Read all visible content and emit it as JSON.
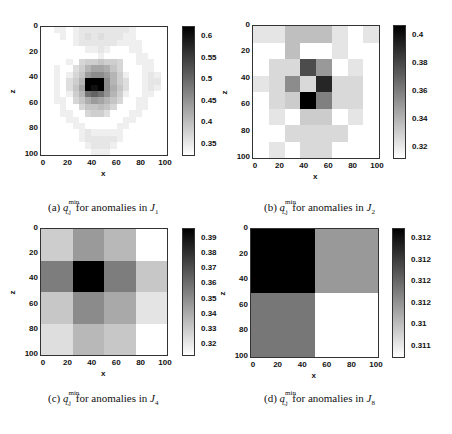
{
  "chart_data": [
    {
      "type": "heatmap",
      "id": "a",
      "title": "(a) a_{i,j}^{min} for anomalies in J_1",
      "caption_prefix": "(a)",
      "caption_sub_label": "J",
      "caption_sub_index": "1",
      "xlabel": "x",
      "ylabel": "z",
      "x_ticks": [
        "0",
        "20",
        "40",
        "60",
        "80",
        "100"
      ],
      "y_ticks": [
        "0",
        "20",
        "40",
        "60",
        "80",
        "100"
      ],
      "colorbar_ticks": [
        "0.6",
        "0.55",
        "0.5",
        "0.45",
        "0.4",
        "0.35"
      ],
      "colorbar_range": [
        0.31,
        0.62
      ],
      "grid_size": [
        20,
        20
      ],
      "values": [
        [
          0.31,
          0.31,
          0.33,
          0.33,
          0.31,
          0.33,
          0.34,
          0.34,
          0.34,
          0.34,
          0.34,
          0.34,
          0.34,
          0.34,
          0.33,
          0.31,
          0.31,
          0.31,
          0.31,
          0.31
        ],
        [
          0.31,
          0.31,
          0.31,
          0.33,
          0.31,
          0.33,
          0.34,
          0.35,
          0.34,
          0.35,
          0.34,
          0.34,
          0.34,
          0.33,
          0.33,
          0.31,
          0.31,
          0.31,
          0.31,
          0.31
        ],
        [
          0.31,
          0.31,
          0.31,
          0.31,
          0.31,
          0.33,
          0.34,
          0.34,
          0.34,
          0.34,
          0.34,
          0.34,
          0.33,
          0.33,
          0.33,
          0.33,
          0.31,
          0.31,
          0.31,
          0.31
        ],
        [
          0.31,
          0.31,
          0.31,
          0.31,
          0.31,
          0.31,
          0.31,
          0.33,
          0.33,
          0.34,
          0.33,
          0.31,
          0.31,
          0.31,
          0.33,
          0.33,
          0.31,
          0.31,
          0.31,
          0.31
        ],
        [
          0.31,
          0.31,
          0.31,
          0.31,
          0.31,
          0.31,
          0.31,
          0.31,
          0.31,
          0.33,
          0.31,
          0.31,
          0.31,
          0.31,
          0.31,
          0.33,
          0.33,
          0.31,
          0.31,
          0.31
        ],
        [
          0.31,
          0.31,
          0.31,
          0.31,
          0.33,
          0.31,
          0.36,
          0.37,
          0.37,
          0.38,
          0.37,
          0.37,
          0.36,
          0.31,
          0.31,
          0.33,
          0.33,
          0.33,
          0.31,
          0.31
        ],
        [
          0.31,
          0.31,
          0.33,
          0.31,
          0.31,
          0.35,
          0.37,
          0.4,
          0.42,
          0.42,
          0.41,
          0.38,
          0.36,
          0.31,
          0.31,
          0.31,
          0.33,
          0.33,
          0.31,
          0.31
        ],
        [
          0.31,
          0.31,
          0.33,
          0.31,
          0.33,
          0.36,
          0.38,
          0.43,
          0.45,
          0.45,
          0.43,
          0.4,
          0.37,
          0.33,
          0.31,
          0.31,
          0.33,
          0.34,
          0.33,
          0.31
        ],
        [
          0.31,
          0.31,
          0.33,
          0.31,
          0.35,
          0.37,
          0.4,
          0.62,
          0.62,
          0.62,
          0.45,
          0.4,
          0.37,
          0.35,
          0.31,
          0.31,
          0.33,
          0.34,
          0.34,
          0.31
        ],
        [
          0.31,
          0.31,
          0.33,
          0.31,
          0.35,
          0.38,
          0.42,
          0.62,
          0.6,
          0.62,
          0.45,
          0.41,
          0.38,
          0.35,
          0.31,
          0.31,
          0.33,
          0.34,
          0.33,
          0.31
        ],
        [
          0.31,
          0.31,
          0.33,
          0.31,
          0.33,
          0.37,
          0.4,
          0.48,
          0.5,
          0.48,
          0.44,
          0.4,
          0.37,
          0.33,
          0.31,
          0.31,
          0.33,
          0.33,
          0.31,
          0.31
        ],
        [
          0.31,
          0.31,
          0.33,
          0.33,
          0.31,
          0.36,
          0.38,
          0.41,
          0.43,
          0.42,
          0.4,
          0.38,
          0.36,
          0.31,
          0.31,
          0.33,
          0.33,
          0.31,
          0.31,
          0.31
        ],
        [
          0.31,
          0.31,
          0.31,
          0.33,
          0.31,
          0.31,
          0.36,
          0.38,
          0.38,
          0.39,
          0.38,
          0.36,
          0.31,
          0.31,
          0.31,
          0.33,
          0.33,
          0.31,
          0.31,
          0.31
        ],
        [
          0.31,
          0.31,
          0.31,
          0.33,
          0.33,
          0.31,
          0.31,
          0.36,
          0.37,
          0.37,
          0.35,
          0.31,
          0.31,
          0.31,
          0.33,
          0.33,
          0.31,
          0.31,
          0.31,
          0.31
        ],
        [
          0.31,
          0.31,
          0.31,
          0.31,
          0.33,
          0.33,
          0.31,
          0.31,
          0.31,
          0.31,
          0.31,
          0.31,
          0.31,
          0.33,
          0.33,
          0.31,
          0.31,
          0.31,
          0.31,
          0.31
        ],
        [
          0.31,
          0.31,
          0.31,
          0.31,
          0.31,
          0.33,
          0.33,
          0.31,
          0.31,
          0.31,
          0.31,
          0.31,
          0.33,
          0.33,
          0.31,
          0.31,
          0.31,
          0.31,
          0.31,
          0.31
        ],
        [
          0.31,
          0.31,
          0.31,
          0.31,
          0.31,
          0.31,
          0.33,
          0.34,
          0.33,
          0.33,
          0.33,
          0.33,
          0.33,
          0.31,
          0.31,
          0.31,
          0.31,
          0.31,
          0.31,
          0.31
        ],
        [
          0.31,
          0.31,
          0.31,
          0.31,
          0.31,
          0.31,
          0.33,
          0.34,
          0.34,
          0.34,
          0.34,
          0.34,
          0.33,
          0.31,
          0.31,
          0.31,
          0.31,
          0.31,
          0.31,
          0.31
        ],
        [
          0.31,
          0.31,
          0.31,
          0.31,
          0.31,
          0.31,
          0.31,
          0.33,
          0.34,
          0.34,
          0.34,
          0.33,
          0.31,
          0.31,
          0.31,
          0.31,
          0.31,
          0.31,
          0.31,
          0.31
        ],
        [
          0.31,
          0.31,
          0.31,
          0.31,
          0.31,
          0.31,
          0.31,
          0.31,
          0.33,
          0.33,
          0.33,
          0.31,
          0.31,
          0.31,
          0.31,
          0.31,
          0.31,
          0.31,
          0.31,
          0.31
        ]
      ]
    },
    {
      "type": "heatmap",
      "id": "b",
      "title": "(b) a_{i,j}^{min} for anomalies in J_2",
      "caption_prefix": "(b)",
      "caption_sub_label": "J",
      "caption_sub_index": "2",
      "xlabel": "x",
      "ylabel": "z",
      "x_ticks": [
        "0",
        "20",
        "40",
        "60",
        "80",
        "100"
      ],
      "y_ticks": [
        "0",
        "20",
        "40",
        "60",
        "80",
        "100"
      ],
      "colorbar_ticks": [
        "0.4",
        "0.38",
        "0.36",
        "0.34",
        "0.32"
      ],
      "colorbar_range": [
        0.31,
        0.41
      ],
      "grid_size": [
        8,
        8
      ],
      "values": [
        [
          0.32,
          0.32,
          0.335,
          0.335,
          0.335,
          0.32,
          0.31,
          0.32
        ],
        [
          0.31,
          0.31,
          0.335,
          0.31,
          0.31,
          0.32,
          0.31,
          0.31
        ],
        [
          0.31,
          0.325,
          0.325,
          0.38,
          0.35,
          0.31,
          0.32,
          0.31
        ],
        [
          0.32,
          0.325,
          0.355,
          0.325,
          0.395,
          0.325,
          0.325,
          0.31
        ],
        [
          0.31,
          0.325,
          0.33,
          0.41,
          0.36,
          0.325,
          0.325,
          0.31
        ],
        [
          0.31,
          0.32,
          0.31,
          0.33,
          0.33,
          0.31,
          0.32,
          0.31
        ],
        [
          0.31,
          0.31,
          0.325,
          0.325,
          0.325,
          0.325,
          0.31,
          0.31
        ],
        [
          0.31,
          0.32,
          0.31,
          0.325,
          0.325,
          0.31,
          0.31,
          0.31
        ]
      ]
    },
    {
      "type": "heatmap",
      "id": "c",
      "title": "(c) a_{i,j}^{min} for anomalies in J_4",
      "caption_prefix": "(c)",
      "caption_sub_label": "J",
      "caption_sub_index": "4",
      "xlabel": "x",
      "ylabel": "z",
      "x_ticks": [
        "0",
        "20",
        "40",
        "60",
        "80",
        "100"
      ],
      "y_ticks": [
        "0",
        "20",
        "40",
        "60",
        "80",
        "100"
      ],
      "colorbar_ticks": [
        "0.39",
        "0.38",
        "0.37",
        "0.36",
        "0.35",
        "0.34",
        "0.33",
        "0.32"
      ],
      "colorbar_range": [
        0.311,
        0.397
      ],
      "grid_size": [
        4,
        4
      ],
      "values": [
        [
          0.328,
          0.345,
          0.335,
          0.311
        ],
        [
          0.355,
          0.397,
          0.355,
          0.33
        ],
        [
          0.33,
          0.35,
          0.34,
          0.32
        ],
        [
          0.322,
          0.335,
          0.33,
          0.311
        ]
      ]
    },
    {
      "type": "heatmap",
      "id": "d",
      "title": "(d) a_{i,j}^{min} for anomalies in J_8",
      "caption_prefix": "(d)",
      "caption_sub_label": "J",
      "caption_sub_index": "8",
      "xlabel": "x",
      "ylabel": "z",
      "x_ticks": [
        "0",
        "20",
        "40",
        "60",
        "80",
        "100"
      ],
      "y_ticks": [
        "0",
        "20",
        "40",
        "60",
        "80",
        "100"
      ],
      "colorbar_ticks": [
        "0.312",
        "0.312",
        "0.312",
        "0.312",
        "0.31",
        "0.311"
      ],
      "colorbar_range": [
        0.311,
        0.3125
      ],
      "grid_size": [
        2,
        2
      ],
      "values": [
        [
          0.3125,
          0.3116
        ],
        [
          0.3118,
          0.311
        ]
      ]
    }
  ],
  "caption": {
    "symbol": "a",
    "sup": "min",
    "sub": "i,j",
    "mid_text": " for anomalies in "
  }
}
